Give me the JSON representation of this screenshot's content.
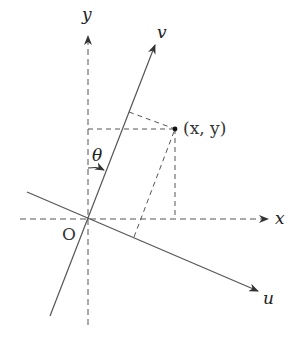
{
  "figure": {
    "labels": {
      "x_axis": "x",
      "y_axis": "y",
      "u_axis": "u",
      "v_axis": "v",
      "origin": "O",
      "angle": "θ",
      "point": "(x, y)"
    },
    "colors": {
      "line": "#555555",
      "text": "#222222",
      "background": "#ffffff"
    },
    "geometry": {
      "origin": [
        88,
        219
      ],
      "point": [
        175,
        129
      ],
      "v_foot": [
        129,
        112
      ],
      "u_foot": [
        134,
        237
      ]
    }
  }
}
